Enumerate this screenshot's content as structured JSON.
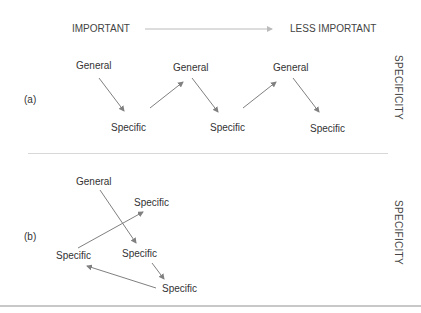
{
  "header": {
    "left_label": "IMPORTANT",
    "right_label": "LESS IMPORTANT"
  },
  "panel_a": {
    "tag": "(a)",
    "axis_label": "SPECIFICITY",
    "nodes": [
      {
        "label": "General"
      },
      {
        "label": "Specific"
      },
      {
        "label": "General"
      },
      {
        "label": "Specific"
      },
      {
        "label": "General"
      },
      {
        "label": "Specific"
      }
    ]
  },
  "panel_b": {
    "tag": "(b)",
    "axis_label": "SPECIFICITY",
    "nodes": [
      {
        "label": "General"
      },
      {
        "label": "Specific"
      },
      {
        "label": "Specific"
      },
      {
        "label": "Specific"
      },
      {
        "label": "Specific"
      }
    ]
  },
  "colors": {
    "text": "#333333",
    "arrow": "#808080",
    "header_arrow": "#bbbbbb",
    "divider": "#d8d8d8"
  }
}
